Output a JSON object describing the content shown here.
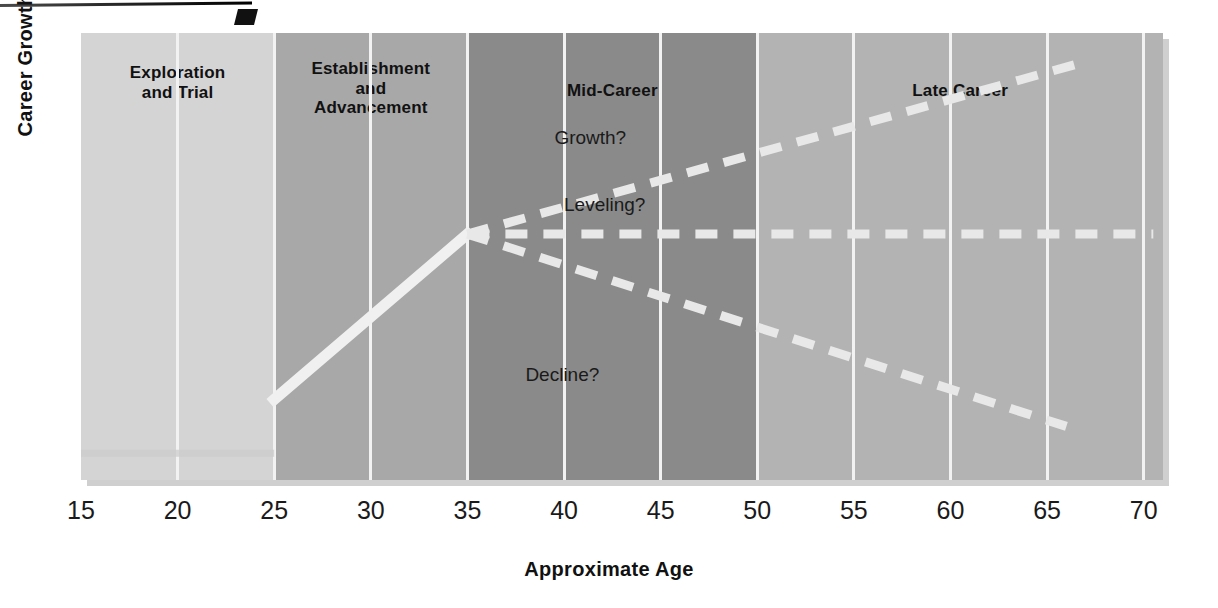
{
  "chart_data": {
    "type": "line",
    "title": "",
    "xlabel": "Approximate Age",
    "ylabel": "Career Growth",
    "xlim": [
      15,
      71
    ],
    "xticks": [
      15,
      20,
      25,
      30,
      35,
      40,
      45,
      50,
      55,
      60,
      65,
      70
    ],
    "grid": true,
    "legend": "none",
    "stages": [
      {
        "label": "Exploration\nand Trial",
        "line1": "Exploration",
        "line2": "and Trial",
        "age_start": 15,
        "age_end": 25,
        "shade": "#d4d4d4"
      },
      {
        "label": "Establishment and Advancement",
        "line1": "Establishment",
        "line2": "and",
        "line3": "Advancement",
        "age_start": 25,
        "age_end": 35,
        "shade": "#a8a8a8"
      },
      {
        "label": "Mid-Career",
        "line1": "Mid-Career",
        "age_start": 35,
        "age_end": 50,
        "shade": "#8a8a8a"
      },
      {
        "label": "Late Career",
        "line1": "Late Career",
        "age_start": 50,
        "age_end": 71,
        "shade": "#b3b3b3"
      }
    ],
    "series": [
      {
        "name": "early-growth",
        "style": "solid",
        "color": "#f0f0f0",
        "points": [
          [
            25,
            18
          ],
          [
            35,
            55
          ]
        ]
      },
      {
        "name": "Growth?",
        "style": "dashed",
        "color": "#e8e8e8",
        "points": [
          [
            35,
            55
          ],
          [
            66.5,
            93
          ]
        ]
      },
      {
        "name": "Leveling?",
        "style": "dashed",
        "color": "#e8e8e8",
        "points": [
          [
            35,
            55
          ],
          [
            70.5,
            55
          ]
        ]
      },
      {
        "name": "Decline?",
        "style": "dashed",
        "color": "#e8e8e8",
        "points": [
          [
            35,
            55
          ],
          [
            66,
            12
          ]
        ]
      },
      {
        "name": "baseline",
        "style": "solid",
        "color": "#cccccc",
        "points": [
          [
            15,
            6
          ],
          [
            25,
            6
          ]
        ]
      }
    ],
    "annotations": [
      {
        "text": "Growth?",
        "age": 39.5,
        "y": 76
      },
      {
        "text": "Leveling?",
        "age": 40.0,
        "y": 61
      },
      {
        "text": "Decline?",
        "age": 38.0,
        "y": 23
      }
    ]
  },
  "xtick_labels": [
    "15",
    "20",
    "25",
    "30",
    "35",
    "40",
    "45",
    "50",
    "55",
    "60",
    "65",
    "70"
  ]
}
